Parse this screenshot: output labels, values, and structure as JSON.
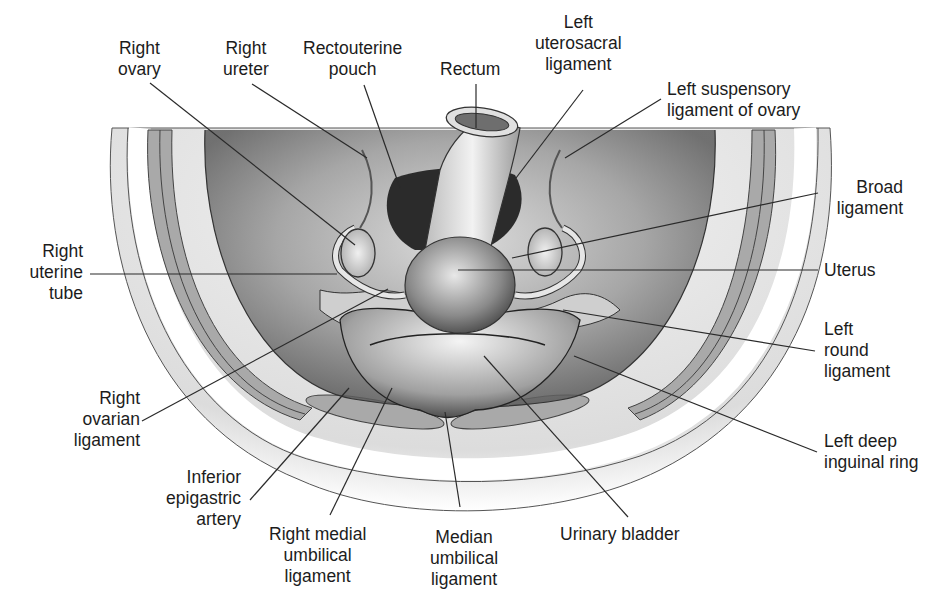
{
  "diagram": {
    "colors": {
      "background": "#ffffff",
      "text": "#1c1c1c",
      "leader_line": "#2a2a2a",
      "muscle_band": "#a9a9a9",
      "tissue_light": "#e6e6e6",
      "tissue_dark": "#3a3a3a"
    },
    "labels": [
      {
        "id": "right-ovary",
        "lines": [
          "Right",
          "ovary"
        ]
      },
      {
        "id": "right-ureter",
        "lines": [
          "Right",
          "ureter"
        ]
      },
      {
        "id": "rectouterine-pouch",
        "lines": [
          "Rectouterine",
          "pouch"
        ]
      },
      {
        "id": "rectum",
        "lines": [
          "Rectum"
        ]
      },
      {
        "id": "left-uterosacral-ligament",
        "lines": [
          "Left",
          "uterosacral",
          "ligament"
        ]
      },
      {
        "id": "left-suspensory-ligament-of-ovary",
        "lines": [
          "Left suspensory",
          "ligament of ovary"
        ]
      },
      {
        "id": "broad-ligament",
        "lines": [
          "Broad",
          "ligament"
        ]
      },
      {
        "id": "uterus",
        "lines": [
          "Uterus"
        ]
      },
      {
        "id": "left-round-ligament",
        "lines": [
          "Left",
          "round",
          "ligament"
        ]
      },
      {
        "id": "left-deep-inguinal-ring",
        "lines": [
          "Left deep",
          "inguinal ring"
        ]
      },
      {
        "id": "urinary-bladder",
        "lines": [
          "Urinary bladder"
        ]
      },
      {
        "id": "median-umbilical-ligament",
        "lines": [
          "Median",
          "umbilical",
          "ligament"
        ]
      },
      {
        "id": "right-medial-umbilical-ligament",
        "lines": [
          "Right medial",
          "umbilical",
          "ligament"
        ]
      },
      {
        "id": "inferior-epigastric-artery",
        "lines": [
          "Inferior",
          "epigastric",
          "artery"
        ]
      },
      {
        "id": "right-ovarian-ligament",
        "lines": [
          "Right",
          "ovarian",
          "ligament"
        ]
      },
      {
        "id": "right-uterine-tube",
        "lines": [
          "Right",
          "uterine",
          "tube"
        ]
      }
    ]
  }
}
